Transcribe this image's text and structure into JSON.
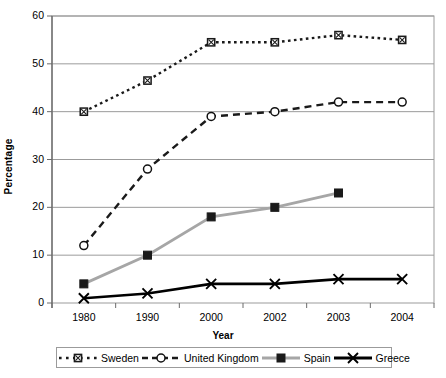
{
  "chart_data": {
    "type": "line",
    "title": "",
    "xlabel": "Year",
    "ylabel": "Percentage",
    "categories": [
      "1980",
      "1990",
      "2000",
      "2002",
      "2003",
      "2004"
    ],
    "ylim": [
      0,
      60
    ],
    "yticks": [
      "0",
      "10",
      "20",
      "30",
      "40",
      "50",
      "60"
    ],
    "grid": true,
    "legend_position": "bottom",
    "series": [
      {
        "name": "Sweden",
        "color": "#1a1a1a",
        "linestyle": "dotted",
        "marker": "square-hatched",
        "values": [
          40,
          46.5,
          54.5,
          54.5,
          56,
          55
        ]
      },
      {
        "name": "United Kingdom",
        "color": "#1a1a1a",
        "linestyle": "dashed",
        "marker": "circle-open",
        "values": [
          12,
          28,
          39,
          40,
          42,
          42
        ]
      },
      {
        "name": "Spain",
        "color": "#a6a6a6",
        "linestyle": "solid",
        "marker": "square-filled",
        "values": [
          4,
          10,
          18,
          20,
          23,
          null
        ]
      },
      {
        "name": "Greece",
        "color": "#000000",
        "linestyle": "solid",
        "marker": "cross",
        "values": [
          1,
          2,
          4,
          4,
          5,
          5
        ]
      }
    ]
  },
  "caption": ""
}
